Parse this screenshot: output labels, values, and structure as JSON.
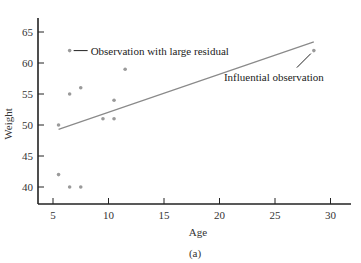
{
  "chart_data": {
    "type": "scatter",
    "title": "",
    "caption": "(a)",
    "xlabel": "Age",
    "ylabel": "Weight",
    "xlim": [
      4,
      31.5
    ],
    "ylim": [
      37.2,
      68
    ],
    "xticks": [
      5,
      10,
      15,
      20,
      25,
      30
    ],
    "yticks": [
      40,
      45,
      50,
      55,
      60,
      65
    ],
    "grid": false,
    "legend": null,
    "points": [
      {
        "x": 5.5,
        "y": 50
      },
      {
        "x": 5.5,
        "y": 42
      },
      {
        "x": 6.5,
        "y": 62
      },
      {
        "x": 6.5,
        "y": 55
      },
      {
        "x": 6.5,
        "y": 40
      },
      {
        "x": 7.5,
        "y": 56
      },
      {
        "x": 7.5,
        "y": 40
      },
      {
        "x": 9.5,
        "y": 51
      },
      {
        "x": 10.5,
        "y": 51
      },
      {
        "x": 10.5,
        "y": 54
      },
      {
        "x": 11.5,
        "y": 59
      },
      {
        "x": 28.5,
        "y": 62
      }
    ],
    "regression_line": {
      "x": [
        5.5,
        28.5
      ],
      "y": [
        49.3,
        63.4
      ]
    },
    "annotations": [
      {
        "text": "Observation with large residual",
        "x": 6.5,
        "y": 62
      },
      {
        "text": "Influential observation",
        "x": 28.5,
        "y": 62
      }
    ],
    "colors": {
      "points": "#9a9a9a",
      "line": "#8a8a8a",
      "axis": "#222222"
    }
  }
}
